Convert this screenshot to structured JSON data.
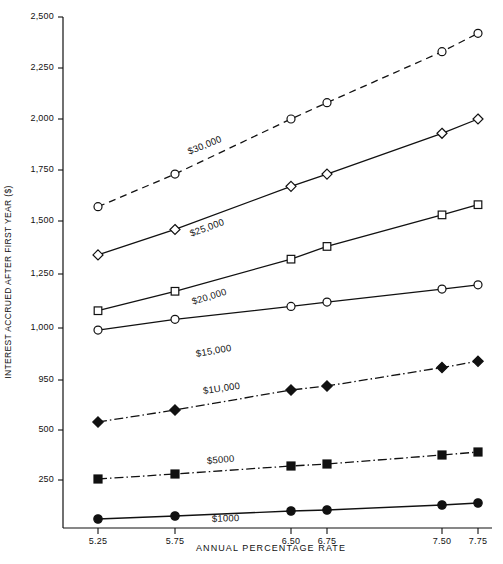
{
  "chart_data": {
    "type": "line",
    "title": "",
    "xlabel": "ANNUAL PERCENTAGE RATE",
    "ylabel": "INTEREST ACCRUED AFTER FIRST YEAR ($)",
    "x": [
      5.25,
      5.75,
      6.5,
      6.75,
      7.5,
      7.75
    ],
    "xtick_labels": [
      "5.25",
      "5.75",
      "6.50",
      "6.75",
      "7.50",
      "7.75"
    ],
    "ytick_labels": [
      "2,500",
      "2,250",
      "2,000",
      "1,750",
      "1,500",
      "1,250",
      "1,000",
      "950",
      "500",
      "250"
    ],
    "ytick_values": [
      2500,
      2250,
      2000,
      1750,
      1500,
      1250,
      1000,
      750,
      500,
      250
    ],
    "ylim": [
      0,
      2500
    ],
    "grid": false,
    "legend_position": "inline-labels",
    "series": [
      {
        "name": "$30,000",
        "marker": "open-circle",
        "line_style": "dashed",
        "values": [
          1570,
          1730,
          2000,
          2080,
          2330,
          2420
        ]
      },
      {
        "name": "$25,000",
        "marker": "open-diamond",
        "line_style": "solid-dotted",
        "values": [
          1340,
          1460,
          1670,
          1730,
          1930,
          2000
        ]
      },
      {
        "name": "$20,000",
        "marker": "open-square",
        "line_style": "solid-dotted",
        "values": [
          1080,
          1170,
          1320,
          1380,
          1530,
          1580
        ]
      },
      {
        "name": "$15,000",
        "marker": "open-circle",
        "line_style": "solid-dotted",
        "values": [
          990,
          1040,
          1100,
          1120,
          1180,
          1200
        ]
      },
      {
        "name": "$1U,000",
        "marker": "filled-diamond",
        "line_style": "dash-dot",
        "values": [
          540,
          600,
          700,
          720,
          810,
          840
        ]
      },
      {
        "name": "$5000",
        "marker": "filled-square",
        "line_style": "dash-dot",
        "values": [
          255,
          280,
          320,
          330,
          375,
          390
        ]
      },
      {
        "name": "$1000",
        "marker": "filled-circle",
        "line_style": "solid",
        "values": [
          55,
          70,
          95,
          100,
          125,
          135
        ]
      }
    ]
  },
  "axis": {
    "line_color": "#111111"
  }
}
